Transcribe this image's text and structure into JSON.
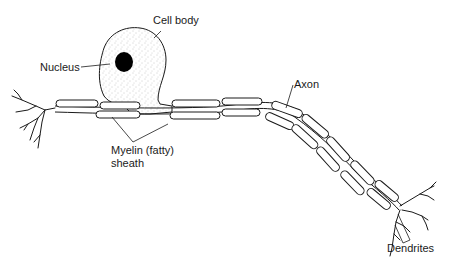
{
  "diagram": {
    "labels": {
      "cell_body": "Cell body",
      "nucleus": "Nucleus",
      "axon": "Axon",
      "myelin_line1": "Myelin (fatty)",
      "myelin_line2": "sheath",
      "dendrites": "Dendrites"
    },
    "colors": {
      "line": "#1a1a1a",
      "fill": "#ffffff",
      "stipple": "#9a9a9a",
      "nucleus": "#000000"
    },
    "parts": [
      "cell-body",
      "nucleus",
      "axon",
      "myelin-sheath",
      "dendrites-left",
      "dendrites-right"
    ]
  }
}
